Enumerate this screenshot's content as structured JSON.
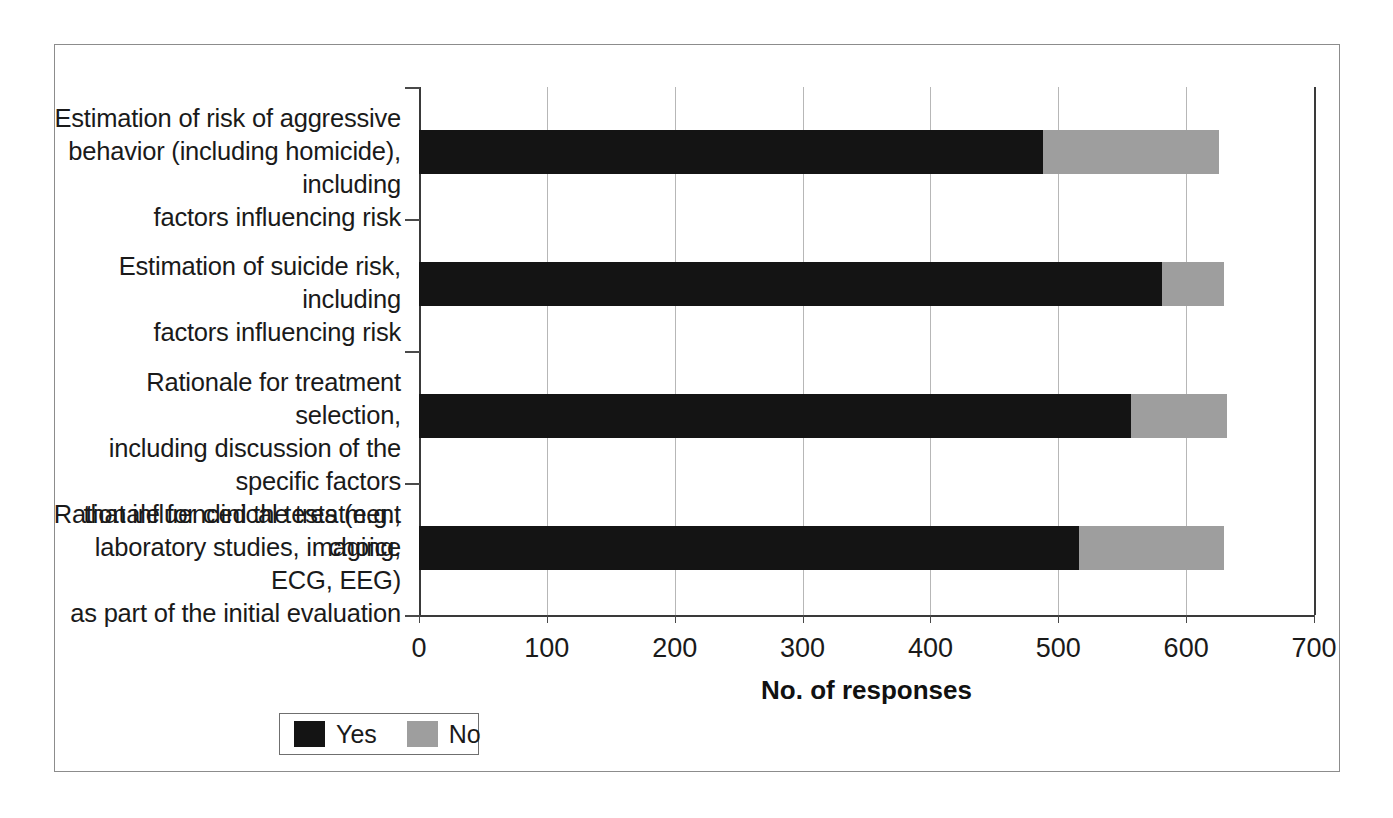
{
  "chart_data": {
    "type": "bar",
    "orientation": "horizontal",
    "stacked": true,
    "title": "",
    "xlabel": "No. of responses",
    "ylabel": "",
    "xlim": [
      0,
      700
    ],
    "xticks": [
      0,
      100,
      200,
      300,
      400,
      500,
      600,
      700
    ],
    "xtick_labels": [
      "0",
      "100",
      "200",
      "300",
      "400",
      "500",
      "600",
      "700"
    ],
    "grid": "vertical",
    "legend_position": "bottom-left",
    "categories": [
      "Estimation of risk of aggressive behavior (including homicide), including factors influencing risk",
      "Estimation of suicide risk, including factors influencing risk",
      "Rationale for treatment selection, including discussion of the specific factors that influenced the treatment choice",
      "Rationale for clinical tests (e.g., laboratory studies, imaging, ECG, EEG) as part of the initial evaluation"
    ],
    "category_lines": [
      [
        "Estimation of risk of aggressive",
        "behavior (including homicide), including",
        "factors influencing risk"
      ],
      [
        "Estimation of suicide risk, including",
        "factors influencing risk"
      ],
      [
        "Rationale for treatment selection,",
        "including discussion of the specific factors",
        "that influenced the treatment choice"
      ],
      [
        "Rationale for clinical tests (e.g.,",
        "laboratory studies, imaging, ECG, EEG)",
        "as part of the initial evaluation"
      ]
    ],
    "series": [
      {
        "name": "Yes",
        "color": "#141414",
        "values": [
          488,
          581,
          557,
          516
        ]
      },
      {
        "name": "No",
        "color": "#9e9e9e",
        "values": [
          138,
          49,
          75,
          114
        ]
      }
    ],
    "totals": [
      626,
      630,
      632,
      630
    ]
  },
  "legend": {
    "items": [
      {
        "label": "Yes",
        "color": "#141414"
      },
      {
        "label": "No",
        "color": "#9e9e9e"
      }
    ]
  },
  "axis": {
    "x_title": "No. of responses"
  }
}
